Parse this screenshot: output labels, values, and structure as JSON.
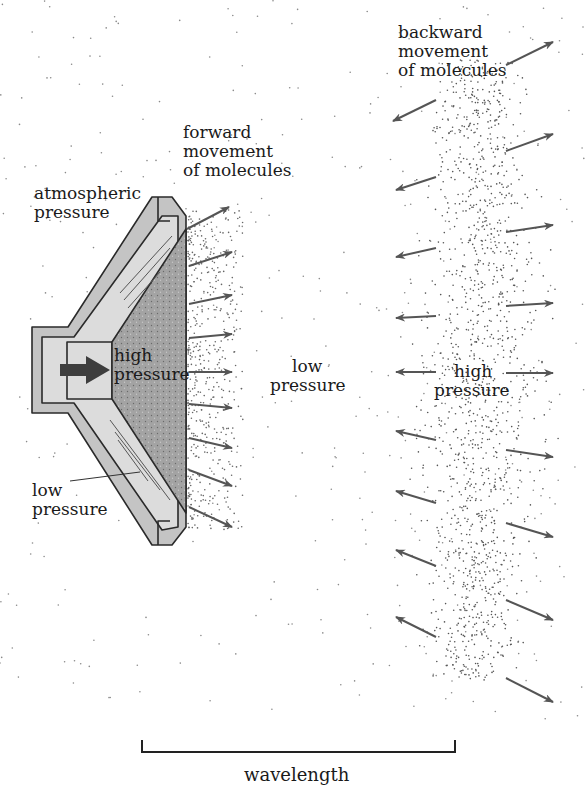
{
  "diagram": {
    "labels": {
      "backward_movement": [
        "backward",
        "movement",
        "of molecules"
      ],
      "forward_movement": [
        "forward",
        "movement",
        "of molecules"
      ],
      "atmospheric_pressure": [
        "atmospheric",
        "pressure"
      ],
      "speaker_high_pressure": [
        "high",
        "pressure"
      ],
      "speaker_low_pressure": [
        "low",
        "pressure"
      ],
      "middle_low_pressure": [
        "low",
        "pressure"
      ],
      "right_high_pressure": [
        "high",
        "pressure"
      ],
      "wavelength": "wavelength"
    },
    "colors": {
      "outline": "#2a2a2a",
      "speaker_frame": "#c4c4c4",
      "speaker_inner": "#dcdcdc",
      "cone_fill": "#9a9a9a",
      "arrow": "#555555",
      "dot": "#666666"
    },
    "forward_arrows_count": 10,
    "backward_arrows_count": 9,
    "outward_arrows_count": 9
  }
}
